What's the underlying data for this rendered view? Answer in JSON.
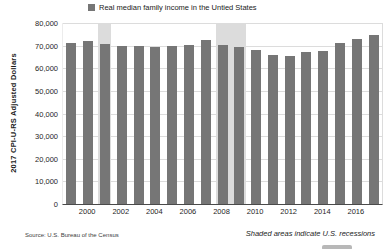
{
  "chart_data": {
    "type": "bar",
    "title": "",
    "legend": {
      "label": "Real median family income in the Untied States",
      "position": "top"
    },
    "ylabel": "2017 CPI-U-RS Adjusted Dollars",
    "xlabel": "",
    "ylim": [
      0,
      80000
    ],
    "ytick_step": 10000,
    "grid": true,
    "categories": [
      1999,
      2000,
      2001,
      2002,
      2003,
      2004,
      2005,
      2006,
      2007,
      2008,
      2009,
      2010,
      2011,
      2012,
      2013,
      2014,
      2015,
      2016,
      2017
    ],
    "values": [
      71100,
      72200,
      70700,
      70000,
      69900,
      69400,
      69800,
      70300,
      72300,
      70400,
      69300,
      67900,
      66000,
      65500,
      67100,
      67500,
      71300,
      72900,
      74900
    ],
    "x_tick_labels": [
      "2000",
      "2002",
      "2004",
      "2006",
      "2008",
      "2010",
      "2012",
      "2014",
      "2016"
    ],
    "recessions": [
      {
        "start_year": 2001,
        "end_year": 2001
      },
      {
        "start_year": 2008,
        "end_year": 2009
      }
    ],
    "annotations": [
      "Shaded areas indicate U.S. recessions"
    ]
  },
  "footer": {
    "source": "Source: U.S. Bureau of the Census",
    "note": "Shaded areas indicate U.S. recessions"
  },
  "colors": {
    "bar": "#767676",
    "legend_swatch": "#6e6e6e",
    "recession_shade": "#dcdcdc",
    "gridline": "#dcdcdc",
    "axis": "#4a4a4a",
    "text": "#262626"
  }
}
